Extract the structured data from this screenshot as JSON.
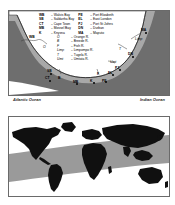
{
  "figure": {
    "panel_a": {
      "name": "southern-africa-coastline-map",
      "ocean_left": "Atlantic Ocean",
      "ocean_right": "Indian Ocean",
      "legend_cities_left": [
        {
          "abbr": "WB",
          "name": "Walvis Bay"
        },
        {
          "abbr": "SB",
          "name": "Saldanha Bay"
        },
        {
          "abbr": "CT",
          "name": "Cape Town"
        },
        {
          "abbr": "MB",
          "name": "Mossel Bay"
        },
        {
          "abbr": "K",
          "name": "Knysna"
        }
      ],
      "legend_cities_right": [
        {
          "abbr": "PE",
          "name": "Port Elizabeth"
        },
        {
          "abbr": "EL",
          "name": "East London"
        },
        {
          "abbr": "PJ",
          "name": "Port St Johns"
        },
        {
          "abbr": "DN",
          "name": "Durban"
        },
        {
          "abbr": "MA",
          "name": "Maputo"
        }
      ],
      "legend_rivers": [
        {
          "abbr": "O",
          "name": "Orange R."
        },
        {
          "abbr": "B",
          "name": "Breede R."
        },
        {
          "abbr": "F",
          "name": "Fish R."
        },
        {
          "abbr": "Limp",
          "name": "Limpompo R."
        },
        {
          "abbr": "T",
          "name": "Tugela R."
        },
        {
          "abbr": "Umt",
          "name": "Umtata R."
        }
      ],
      "map_labels": [
        {
          "text": "WB",
          "x": 20,
          "y": 25,
          "style": "bold"
        },
        {
          "text": "SB",
          "x": 38,
          "y": 59,
          "style": "bold"
        },
        {
          "text": "CT",
          "x": 36,
          "y": 66,
          "style": "bold"
        },
        {
          "text": "B",
          "x": 49,
          "y": 66,
          "style": "bold"
        },
        {
          "text": "MB",
          "x": 64,
          "y": 70,
          "style": "bold"
        },
        {
          "text": "K",
          "x": 81,
          "y": 69,
          "style": "bold"
        },
        {
          "text": "PE",
          "x": 93,
          "y": 69,
          "style": "bold"
        },
        {
          "text": "F",
          "x": 88,
          "y": 62,
          "style": "bold"
        },
        {
          "text": "EL",
          "x": 99,
          "y": 61,
          "style": "bold"
        },
        {
          "text": "Umt",
          "x": 101,
          "y": 50,
          "style": "italic"
        },
        {
          "text": "PJ",
          "x": 106,
          "y": 56,
          "style": "bold"
        },
        {
          "text": "DN",
          "x": 119,
          "y": 42,
          "style": "bold"
        },
        {
          "text": "T",
          "x": 110,
          "y": 37,
          "style": "italic"
        },
        {
          "text": "Limp",
          "x": 126,
          "y": 27,
          "style": "italic"
        },
        {
          "text": "MA",
          "x": 132,
          "y": 18,
          "style": "bold"
        },
        {
          "text": "O",
          "x": 34,
          "y": 35,
          "style": "italic"
        }
      ],
      "colors": {
        "land": "#ffffff",
        "shelf_band": "#6e6e6e",
        "ocean": "#a8a8a8",
        "coast_line": "#2a2a2a",
        "border": "#6a6a6a"
      }
    },
    "panel_b": {
      "name": "world-map-distribution",
      "colors": {
        "land": "#101010",
        "ocean": "#ffffff",
        "zone_band": "#9a9a9a",
        "border": "#6a6a6a"
      }
    }
  }
}
